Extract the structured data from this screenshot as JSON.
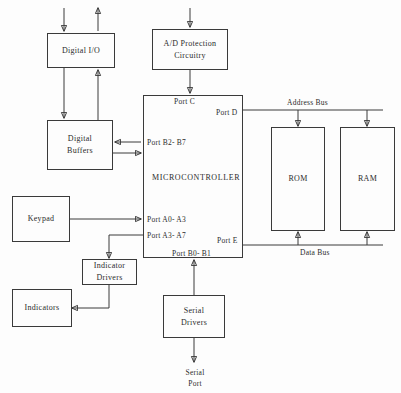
{
  "diagram": {
    "line_color": "#3a3a3a",
    "background": "#fdfdfd",
    "blocks": {
      "digital_io": {
        "line1": "Digital I/O"
      },
      "ad_protection": {
        "line1": "A/D Protection",
        "line2": "Circuitry"
      },
      "digital_buffers": {
        "line1": "Digital",
        "line2": "Buffers"
      },
      "microcontroller": {
        "label": "MICROCONTROLLER"
      },
      "rom": {
        "label": "ROM"
      },
      "ram": {
        "label": "RAM"
      },
      "keypad": {
        "label": "Keypad"
      },
      "indicator_drivers": {
        "line1": "Indicator",
        "line2": "Drivers"
      },
      "indicators": {
        "label": "Indicators"
      },
      "serial_drivers": {
        "line1": "Serial",
        "line2": "Drivers"
      }
    },
    "ports": {
      "port_c": "Port C",
      "port_d": "Port D",
      "port_b2_b7": "Port B2- B7",
      "port_a0_a3": "Port A0- A3",
      "port_a3_a7": "Port A3- A7",
      "port_e": "Port E",
      "port_b0_b1": "Port B0- B1"
    },
    "buses": {
      "address_bus": "Address Bus",
      "data_bus": "Data Bus"
    },
    "terminals": {
      "serial_port_line1": "Serial",
      "serial_port_line2": "Port"
    }
  }
}
